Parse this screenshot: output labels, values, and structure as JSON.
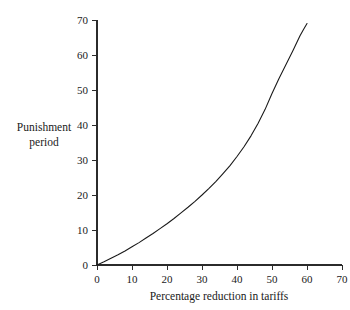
{
  "chart_data": {
    "type": "line",
    "title": "",
    "xlabel": "Percentage reduction in tariffs",
    "ylabel": "Punishment period",
    "ylabel_line1": "Punishment",
    "ylabel_line2": "period",
    "xlim": [
      0,
      70
    ],
    "ylim": [
      0,
      70
    ],
    "xticks": [
      0,
      10,
      20,
      30,
      40,
      50,
      60,
      70
    ],
    "yticks": [
      0,
      10,
      20,
      30,
      40,
      50,
      60,
      70
    ],
    "xtick_labels": [
      "0",
      "10",
      "20",
      "30",
      "40",
      "50",
      "60",
      "70"
    ],
    "ytick_labels": [
      "0",
      "10",
      "20",
      "30",
      "40",
      "50",
      "60",
      "70"
    ],
    "grid": false,
    "legend": false,
    "legend_position": "none",
    "curve_color": "#1a1a1a",
    "axis_color": "#2b2b2b",
    "background_color": "#ffffff",
    "series": [
      {
        "name": "Punishment period",
        "x": [
          0,
          2,
          4,
          6,
          8,
          10,
          12,
          14,
          16,
          18,
          20,
          22,
          24,
          26,
          28,
          30,
          32,
          34,
          36,
          38,
          40,
          42,
          44,
          46,
          48,
          50,
          52,
          54,
          56,
          58,
          59,
          60
        ],
        "values": [
          0,
          0.9,
          1.9,
          2.9,
          4.0,
          5.2,
          6.4,
          7.7,
          9.0,
          10.4,
          11.8,
          13.3,
          14.9,
          16.5,
          18.2,
          20.0,
          21.9,
          23.9,
          26.1,
          28.4,
          31.0,
          33.8,
          36.9,
          40.4,
          44.4,
          49.0,
          53.3,
          57.3,
          61.3,
          65.5,
          67.3,
          69.0
        ]
      }
    ]
  },
  "axes": {
    "x_axis_name": "x-axis",
    "y_axis_name": "y-axis"
  }
}
